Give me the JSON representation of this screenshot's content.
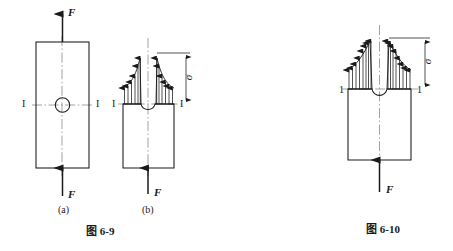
{
  "figures": [
    {
      "id": "fig-6-9",
      "caption": "图 6-9",
      "subfigures": [
        {
          "id": "a",
          "label": "(a)",
          "description": "rectangular-bar-with-central-hole",
          "force_labels": [
            "F",
            "F"
          ],
          "section_labels": [
            "I",
            "I"
          ]
        },
        {
          "id": "b",
          "label": "(b)",
          "description": "stress-distribution-at-hole-section",
          "force_labels": [
            "F"
          ],
          "section_labels": [
            "I",
            "I"
          ],
          "stress_label": "σ"
        }
      ]
    },
    {
      "id": "fig-6-10",
      "caption": "图 6-10",
      "description": "stress-distribution-at-notched-section",
      "force_labels": [
        "F"
      ],
      "section_labels": [
        "1",
        "1"
      ],
      "stress_label": "σ"
    }
  ],
  "colors": {
    "line": "#1a1a1a",
    "centerline": "#8c8c8c",
    "background": "#ffffff"
  },
  "text": {
    "force": "F",
    "section_roman": "I",
    "section_arabic": "1",
    "sigma": "σ",
    "label_a": "(a)",
    "label_b": "(b)",
    "caption_left": "图 6-9",
    "caption_right": "图 6-10"
  }
}
